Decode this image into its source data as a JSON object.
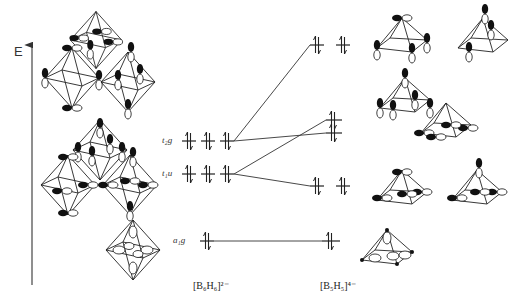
{
  "diagram": {
    "type": "molecular-orbital-correlation",
    "axis": {
      "label": "E",
      "direction": "up"
    },
    "left_molecule": {
      "formula": "[B6H6]2-",
      "formula_display": "[B₆H₆]²⁻",
      "levels": [
        {
          "symmetry": "t2g",
          "label": "t₂g",
          "degeneracy": 3,
          "electrons": 6,
          "y": 141
        },
        {
          "symmetry": "t1u",
          "label": "t₁u",
          "degeneracy": 3,
          "electrons": 6,
          "y": 174
        },
        {
          "symmetry": "a1g",
          "label": "a₁g",
          "degeneracy": 1,
          "electrons": 2,
          "y": 241
        }
      ]
    },
    "right_molecule": {
      "formula": "[B5H5]4-",
      "formula_display": "[B₅H₅]⁴⁻",
      "levels": [
        {
          "degeneracy": 2,
          "electrons": 4,
          "y": 45
        },
        {
          "degeneracy": 1,
          "electrons": 2,
          "y": 120
        },
        {
          "degeneracy": 1,
          "electrons": 2,
          "y": 133
        },
        {
          "degeneracy": 2,
          "electrons": 4,
          "y": 186
        },
        {
          "degeneracy": 1,
          "electrons": 2,
          "y": 241
        }
      ]
    },
    "correlations": [
      {
        "from": "t2g",
        "to_level_index": 0
      },
      {
        "from": "t2g",
        "to_level_index": 2
      },
      {
        "from": "t1u",
        "to_level_index": 1
      },
      {
        "from": "t1u",
        "to_level_index": 3
      },
      {
        "from": "a1g",
        "to_level_index": 4
      }
    ],
    "orbital_sketches": {
      "left_octahedra": 7,
      "right_square_pyramids": 7
    },
    "electron_symbol": "⇅"
  }
}
